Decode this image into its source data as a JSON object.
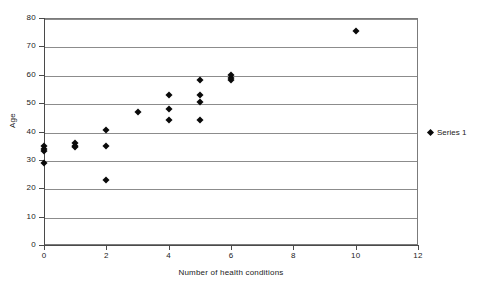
{
  "chart_data": {
    "type": "scatter",
    "title": "",
    "xlabel": "Number of health conditions",
    "ylabel": "Age",
    "xlim": [
      0,
      12
    ],
    "ylim": [
      0,
      80
    ],
    "xticks": [
      0,
      2,
      4,
      6,
      8,
      10,
      12
    ],
    "yticks": [
      0,
      10,
      20,
      30,
      40,
      50,
      60,
      70,
      80
    ],
    "grid": "horizontal",
    "legend_position": "right",
    "series": [
      {
        "name": "Series 1",
        "marker": "diamond",
        "color": "#0a0a0a",
        "points": [
          {
            "x": 0,
            "y": 35
          },
          {
            "x": 0,
            "y": 34
          },
          {
            "x": 0,
            "y": 33
          },
          {
            "x": 0,
            "y": 29
          },
          {
            "x": 1,
            "y": 36
          },
          {
            "x": 1,
            "y": 35
          },
          {
            "x": 1,
            "y": 34.5
          },
          {
            "x": 2,
            "y": 40.5
          },
          {
            "x": 2,
            "y": 35
          },
          {
            "x": 2,
            "y": 23
          },
          {
            "x": 3,
            "y": 47
          },
          {
            "x": 4,
            "y": 53
          },
          {
            "x": 4,
            "y": 48
          },
          {
            "x": 4,
            "y": 44
          },
          {
            "x": 5,
            "y": 58
          },
          {
            "x": 5,
            "y": 53
          },
          {
            "x": 5,
            "y": 50.5
          },
          {
            "x": 5,
            "y": 44
          },
          {
            "x": 6,
            "y": 60
          },
          {
            "x": 6,
            "y": 59
          },
          {
            "x": 6,
            "y": 58
          },
          {
            "x": 10,
            "y": 75.5
          }
        ]
      }
    ]
  },
  "legend": {
    "entries": [
      {
        "label": "Series 1"
      }
    ]
  },
  "axes": {
    "x_title": "Number of health conditions",
    "y_title": "Age",
    "x_tick_labels": [
      "0",
      "2",
      "4",
      "6",
      "8",
      "10",
      "12"
    ],
    "y_tick_labels": [
      "0",
      "10",
      "20",
      "30",
      "40",
      "50",
      "60",
      "70",
      "80"
    ]
  }
}
